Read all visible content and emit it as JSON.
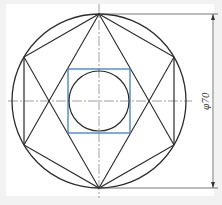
{
  "drawing": {
    "title": "Hexagon inscribed in circle with inscribed square and circle",
    "dimension_label": "φ70",
    "colors": {
      "background": "#f2f2f2",
      "paper": "#ffffff",
      "line": "#2b2b2b",
      "square": "#3d7fd0",
      "centerline": "#777777"
    }
  }
}
